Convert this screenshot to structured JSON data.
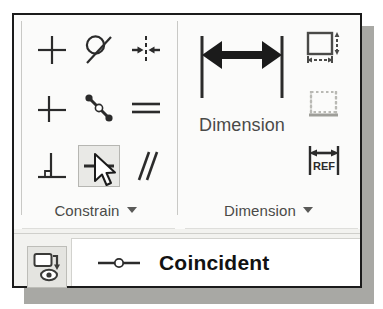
{
  "window": {
    "title": "Constrain / Dimension ribbon panel"
  },
  "panels": [
    {
      "name": "constrain",
      "label": "Constrain",
      "caret": "dropdown-caret",
      "buttons": [
        {
          "id": "perpendicular",
          "name": "perpendicular-constraint",
          "tooltip": "Perpendicular",
          "row": 1,
          "col": 1,
          "state": "normal"
        },
        {
          "id": "tangent",
          "name": "tangent-constraint",
          "tooltip": "Tangent",
          "row": 1,
          "col": 2,
          "state": "normal"
        },
        {
          "id": "symmetric",
          "name": "symmetric-constraint",
          "tooltip": "Symmetric",
          "row": 1,
          "col": 3,
          "state": "normal"
        },
        {
          "id": "horizontal",
          "name": "horizontal-constraint",
          "tooltip": "Horizontal",
          "row": 2,
          "col": 1,
          "state": "normal"
        },
        {
          "id": "smooth",
          "name": "smooth-g2-constraint",
          "tooltip": "Smooth (G2)",
          "row": 2,
          "col": 2,
          "state": "normal"
        },
        {
          "id": "equal",
          "name": "equal-constraint",
          "tooltip": "Equal",
          "row": 2,
          "col": 3,
          "state": "normal"
        },
        {
          "id": "vertical",
          "name": "vertical-constraint",
          "tooltip": "Vertical",
          "row": 3,
          "col": 1,
          "state": "normal"
        },
        {
          "id": "coincident",
          "name": "coincident-constraint",
          "tooltip": "Coincident",
          "row": 3,
          "col": 2,
          "state": "hovered"
        },
        {
          "id": "parallel",
          "name": "parallel-constraint",
          "tooltip": "Parallel",
          "row": 3,
          "col": 3,
          "state": "normal"
        }
      ]
    },
    {
      "name": "dimension",
      "label": "Dimension",
      "caret": "dropdown-caret",
      "primary": {
        "id": "dimension",
        "name": "dimension-button",
        "label": "Dimension"
      },
      "side_buttons": [
        {
          "id": "auto-dimension",
          "name": "auto-dimension-button",
          "tooltip": "Auto Dimension",
          "state": "normal"
        },
        {
          "id": "show-constraints",
          "name": "show-constraints-button",
          "tooltip": "Show Constraints",
          "state": "disabled"
        },
        {
          "id": "reference-dimension",
          "name": "reference-dimension-button",
          "tooltip": "Reference Dimension",
          "label": "REF",
          "state": "normal"
        }
      ]
    }
  ],
  "tooltip": {
    "icon": "coincident-icon",
    "title": "Coincident"
  },
  "show_me": {
    "name": "show-me-animation-button",
    "icon": "show-me-eye-icon"
  },
  "cursor": {
    "name": "mouse-pointer",
    "over": "coincident-constraint",
    "x": 96,
    "y": 158
  },
  "colors": {
    "panel_background": "#fbfbfa",
    "frame_border": "#1b1b1b",
    "shadow": "#a8a8a4",
    "label_text": "#4a4a48",
    "tooltip_text": "#121212",
    "hover_fill": "#e9e9e6",
    "hover_border": "#b6b6b2",
    "icon_stroke": "#2b2b2b",
    "disabled_icon": "#b9b9b4"
  }
}
